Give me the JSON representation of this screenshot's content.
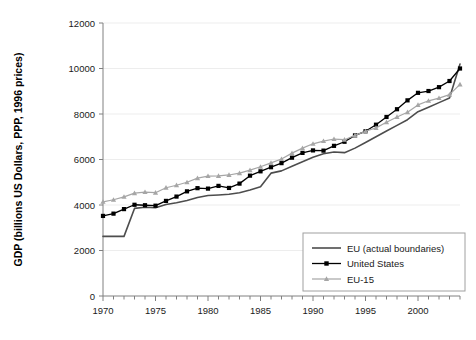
{
  "chart_data": {
    "type": "line",
    "title": "",
    "xlabel": "",
    "ylabel": "GDP (billions US Dollars, PPP, 1996 prices)",
    "xlim": [
      1970,
      2004
    ],
    "ylim": [
      0,
      12000
    ],
    "ytick_step": 2000,
    "xtick_step": 1,
    "xtick_label_step": 5,
    "grid": "horizontal-faint",
    "legend_position": "inside-bottom-right",
    "yticks": [
      0,
      2000,
      4000,
      6000,
      8000,
      10000,
      12000
    ],
    "ytick_labels": [
      "0",
      "2000",
      "4000",
      "6000",
      "8000",
      "10000",
      "12000"
    ],
    "xticks": [
      1970,
      1971,
      1972,
      1973,
      1974,
      1975,
      1976,
      1977,
      1978,
      1979,
      1980,
      1981,
      1982,
      1983,
      1984,
      1985,
      1986,
      1987,
      1988,
      1989,
      1990,
      1991,
      1992,
      1993,
      1994,
      1995,
      1996,
      1997,
      1998,
      1999,
      2000,
      2001,
      2002,
      2003,
      2004
    ],
    "xtick_labels": [
      "1970",
      "1975",
      "1980",
      "1985",
      "1990",
      "1995",
      "2000"
    ],
    "xtick_label_values": [
      1970,
      1975,
      1980,
      1985,
      1990,
      1995,
      2000
    ],
    "x": [
      1970,
      1971,
      1972,
      1973,
      1974,
      1975,
      1976,
      1977,
      1978,
      1979,
      1980,
      1981,
      1982,
      1983,
      1984,
      1985,
      1986,
      1987,
      1988,
      1989,
      1990,
      1991,
      1992,
      1993,
      1994,
      1995,
      1996,
      1997,
      1998,
      1999,
      2000,
      2001,
      2002,
      2003,
      2004
    ],
    "series": [
      {
        "name": "EU (actual boundaries)",
        "color": "#4d4d4d",
        "marker": "none",
        "linewidth": 1.6,
        "values": [
          2620,
          2620,
          2620,
          3850,
          3900,
          3880,
          4020,
          4100,
          4200,
          4330,
          4420,
          4440,
          4470,
          4540,
          4660,
          4800,
          5400,
          5500,
          5700,
          5900,
          6100,
          6250,
          6330,
          6300,
          6500,
          6750,
          7000,
          7250,
          7500,
          7750,
          8100,
          8300,
          8500,
          8700,
          10200
        ]
      },
      {
        "name": "United States",
        "color": "#000000",
        "marker": "square",
        "linewidth": 1.3,
        "values": [
          3520,
          3620,
          3820,
          4010,
          3990,
          3970,
          4180,
          4370,
          4600,
          4740,
          4720,
          4840,
          4750,
          4940,
          5290,
          5480,
          5660,
          5840,
          6080,
          6290,
          6400,
          6390,
          6600,
          6780,
          7060,
          7240,
          7530,
          7870,
          8210,
          8600,
          8930,
          9010,
          9180,
          9450,
          10000
        ]
      },
      {
        "name": "EU-15",
        "color": "#a6a6a6",
        "marker": "triangle",
        "linewidth": 1.2,
        "values": [
          4140,
          4230,
          4360,
          4520,
          4570,
          4540,
          4760,
          4870,
          5000,
          5180,
          5270,
          5280,
          5320,
          5400,
          5530,
          5680,
          5850,
          6020,
          6280,
          6500,
          6690,
          6810,
          6900,
          6870,
          7060,
          7240,
          7390,
          7640,
          7870,
          8080,
          8400,
          8580,
          8700,
          8850,
          9300
        ]
      }
    ]
  },
  "legend": {
    "items": [
      {
        "label": "EU (actual boundaries)"
      },
      {
        "label": "United States"
      },
      {
        "label": "EU-15"
      }
    ]
  },
  "axis": {
    "y_title": "GDP (billions US Dollars, PPP, 1996 prices)"
  }
}
